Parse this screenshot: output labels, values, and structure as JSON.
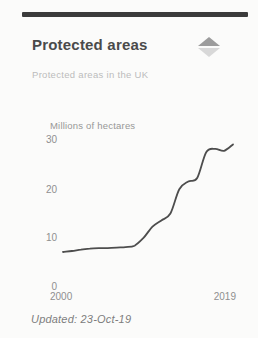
{
  "card": {
    "title": "Protected areas",
    "subtitle": "Protected areas in the UK",
    "updated": "Updated: 23-Oct-19",
    "trend_icon": "up-down-triangles",
    "colors": {
      "accent_bar": "#3b3b3b",
      "line": "#4d4d4d",
      "title_text": "#4a4a4a",
      "muted_text": "#8f8f8f",
      "icon_up": "#9c9c9c",
      "icon_down": "#d8d8d8"
    }
  },
  "chart_data": {
    "type": "line",
    "title": "Protected areas",
    "subtitle": "Protected areas in the UK",
    "ylabel": "Millions of hectares",
    "xlabel": "",
    "x": [
      2000,
      2001,
      2002,
      2003,
      2004,
      2005,
      2006,
      2007,
      2008,
      2009,
      2010,
      2011,
      2012,
      2013,
      2014,
      2015,
      2016,
      2017,
      2018,
      2019
    ],
    "values": [
      7.4,
      7.6,
      7.9,
      8.1,
      8.2,
      8.2,
      8.3,
      8.4,
      8.7,
      10.3,
      12.6,
      13.9,
      15.3,
      20.3,
      21.9,
      22.6,
      27.9,
      28.6,
      28.2,
      29.5
    ],
    "xlim": [
      2000,
      2019
    ],
    "ylim": [
      0,
      30
    ],
    "yticks": [
      0,
      10,
      20,
      30
    ],
    "ytick_labels_top_to_bottom": [
      "30",
      "20",
      "10",
      "0"
    ],
    "xtick_labels": [
      "2000",
      "2019"
    ],
    "grid": false,
    "legend": "none",
    "line_color": "#4d4d4d"
  }
}
